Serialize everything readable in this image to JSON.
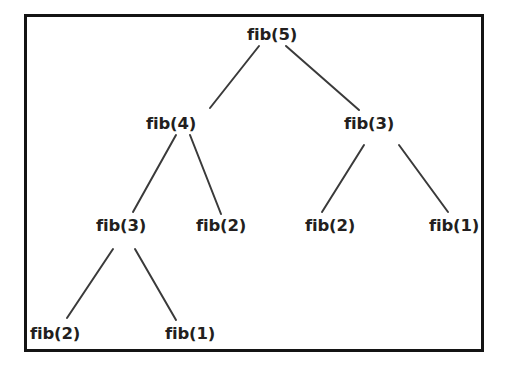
{
  "figure": {
    "background_color": "#ffffff",
    "frame": {
      "border_color": "#141414",
      "border_width_px": 3,
      "fill_color": "#ffffff",
      "x": 24,
      "y": 14,
      "width": 460,
      "height": 338
    },
    "text_color": "#231f20",
    "edge_color": "#3a3a3a"
  },
  "chart_data": {
    "type": "diagram",
    "diagram_type": "recursion-tree",
    "root": "n0",
    "nodes": [
      {
        "id": "n0",
        "label": "fib(5)",
        "level": 0,
        "x": 272,
        "y": 35
      },
      {
        "id": "n1",
        "label": "fib(4)",
        "level": 1,
        "x": 171,
        "y": 124
      },
      {
        "id": "n2",
        "label": "fib(3)",
        "level": 1,
        "x": 369,
        "y": 124
      },
      {
        "id": "n3",
        "label": "fib(3)",
        "level": 2,
        "x": 121,
        "y": 226
      },
      {
        "id": "n4",
        "label": "fib(2)",
        "level": 2,
        "x": 221,
        "y": 226
      },
      {
        "id": "n5",
        "label": "fib(2)",
        "level": 2,
        "x": 330,
        "y": 226
      },
      {
        "id": "n6",
        "label": "fib(1)",
        "level": 2,
        "x": 454,
        "y": 226
      },
      {
        "id": "n7",
        "label": "fib(2)",
        "level": 3,
        "x": 55,
        "y": 334
      },
      {
        "id": "n8",
        "label": "fib(1)",
        "level": 3,
        "x": 190,
        "y": 334
      }
    ],
    "edges": [
      {
        "from": "n0",
        "to": "n1",
        "x1": 259,
        "y1": 46,
        "x2": 210,
        "y2": 108
      },
      {
        "from": "n0",
        "to": "n2",
        "x1": 286,
        "y1": 46,
        "x2": 359,
        "y2": 110
      },
      {
        "from": "n1",
        "to": "n3",
        "x1": 176,
        "y1": 135,
        "x2": 133,
        "y2": 212
      },
      {
        "from": "n1",
        "to": "n4",
        "x1": 190,
        "y1": 135,
        "x2": 221,
        "y2": 214
      },
      {
        "from": "n2",
        "to": "n5",
        "x1": 364,
        "y1": 145,
        "x2": 322,
        "y2": 212
      },
      {
        "from": "n2",
        "to": "n6",
        "x1": 399,
        "y1": 145,
        "x2": 448,
        "y2": 212
      },
      {
        "from": "n3",
        "to": "n7",
        "x1": 113,
        "y1": 249,
        "x2": 67,
        "y2": 318
      },
      {
        "from": "n3",
        "to": "n8",
        "x1": 135,
        "y1": 249,
        "x2": 176,
        "y2": 320
      }
    ]
  }
}
